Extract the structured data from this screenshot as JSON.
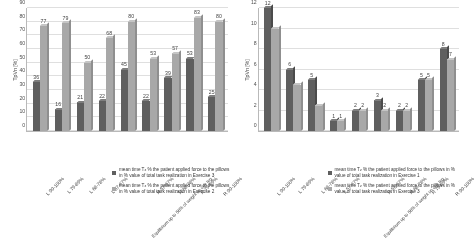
{
  "chart_data": [
    {
      "type": "bar",
      "panel": "left",
      "title": "",
      "xlabel": "",
      "ylabel": "TpVn [%]",
      "ylim": [
        0,
        90
      ],
      "yticks": [
        0,
        10,
        20,
        30,
        40,
        50,
        60,
        70,
        80,
        90
      ],
      "grid": true,
      "legend_position": "below",
      "categories": [
        "L 90-100%",
        "L 79-89%",
        "L 68-78%",
        "L 57-67%",
        "Equilibrium up to 56% of weight on one leg",
        "R 57-67%",
        "R 68-78%",
        "R 79-89%",
        "R 90-100%"
      ],
      "series": [
        {
          "name": "mean time Tz % the patient applied force to the pillows in % value of total task realization in Exercise 3",
          "color": "#5b5b5b",
          "values": [
            36,
            16,
            21,
            22,
            45,
            22,
            39,
            53,
            25
          ]
        },
        {
          "name": "mean time Tz % the patient applied force to the pillows in % value of total task realization in Exercise 2",
          "color": "#a8a8a8",
          "values": [
            77,
            79,
            50,
            68,
            80,
            53,
            57,
            83,
            80
          ]
        }
      ]
    },
    {
      "type": "bar",
      "panel": "right",
      "title": "",
      "xlabel": "",
      "ylabel": "TpVn [%]",
      "ylim": [
        0,
        12
      ],
      "yticks": [
        0,
        2,
        4,
        6,
        8,
        10,
        12
      ],
      "grid": true,
      "legend_position": "below",
      "categories": [
        "L 90-100%",
        "L 79-89%",
        "L 68-78%",
        "L 57-67%",
        "Equilibrium up to 56% of weight on one leg",
        "R 57-67%",
        "R 68-78%",
        "R 79-89%",
        "R 90-100%"
      ],
      "series": [
        {
          "name": "mean time Tz % the patient applied force to the pillows in % value of total task realization in Exercise 1",
          "color": "#5b5b5b",
          "values": [
            12,
            6,
            5,
            1,
            2,
            3,
            2,
            5,
            8
          ]
        },
        {
          "name": "mean time Tz % the patient applied force to the pillows in % value of total task realization in Exercise 3",
          "color": "#a8a8a8",
          "values": [
            10,
            4.5,
            2.5,
            1,
            2,
            2,
            2,
            5,
            7
          ]
        }
      ],
      "data_labels": {
        "s0": [
          "12",
          "6",
          "5",
          "1",
          "2",
          "3",
          "2",
          "5",
          "8"
        ],
        "s1": [
          "",
          "",
          "",
          "1",
          "2",
          "2",
          "2",
          "5",
          "7"
        ]
      }
    }
  ],
  "left_panel": {
    "ylabel": "TpVn [%]",
    "yticks": [
      "0",
      "10",
      "20",
      "30",
      "40",
      "50",
      "60",
      "70",
      "80",
      "90"
    ],
    "xticks": [
      "L 90-100%",
      "L 79-89%",
      "L 68-78%",
      "L 57-67%",
      "Equilibrium up to 56% of weight on one leg",
      "R 57-67%",
      "R 68-78%",
      "R 79-89%",
      "R 90-100%"
    ],
    "bar_labels_dark": [
      "36",
      "16",
      "21",
      "22",
      "45",
      "22",
      "39",
      "53",
      "25"
    ],
    "bar_labels_light": [
      "77",
      "79",
      "50",
      "68",
      "80",
      "53",
      "57",
      "83",
      "80"
    ],
    "legend": [
      {
        "pre": "mean time T",
        "sub": "z",
        "post": " % the patient applied force to the pillows in % value of total task realization in Exercise 3",
        "swatch": "dark"
      },
      {
        "pre": "mean time T",
        "sub": "z",
        "post": " % the patient applied force to the pillows in % value of total task realization in Exercise 2",
        "swatch": "light"
      }
    ]
  },
  "right_panel": {
    "ylabel": "TpVn [%]",
    "yticks": [
      "0",
      "2",
      "4",
      "6",
      "8",
      "10",
      "12"
    ],
    "xticks": [
      "L 90-100%",
      "L 79-89%",
      "L 68-78%",
      "L 57-67%",
      "Equilibrium up to 56% of weight on one leg",
      "R 57-67%",
      "R 68-78%",
      "R 79-89%",
      "R 90-100%"
    ],
    "bar_labels_dark": [
      "12",
      "6",
      "5",
      "1",
      "2",
      "3",
      "2",
      "5",
      "8"
    ],
    "bar_labels_light": [
      "",
      "",
      "",
      "1",
      "2",
      "2",
      "2",
      "5",
      "7"
    ],
    "legend": [
      {
        "pre": "mean time T",
        "sub": "z",
        "post": " % the patient applied force to the pillows in % value of total task realization in Exercise 1",
        "swatch": "dark"
      },
      {
        "pre": "mean time T",
        "sub": "z",
        "post": " % the patient applied force to the pillows in % value of total task realization in Exercise 3",
        "swatch": "light"
      }
    ]
  }
}
